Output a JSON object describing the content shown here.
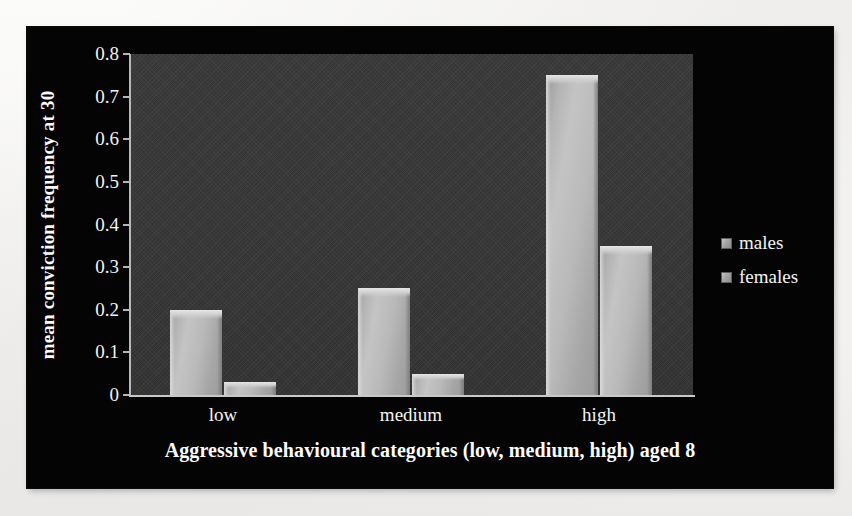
{
  "chart_data": {
    "type": "bar",
    "title": "",
    "xlabel": "Aggressive behavioural categories (low, medium, high) aged 8",
    "ylabel": "mean conviction frequency at 30",
    "categories": [
      "low",
      "medium",
      "high"
    ],
    "series": [
      {
        "name": "males",
        "values": [
          0.2,
          0.25,
          0.75
        ]
      },
      {
        "name": "females",
        "values": [
          0.03,
          0.05,
          0.35
        ]
      }
    ],
    "ylim": [
      0,
      0.8
    ],
    "ytick_labels": [
      "0.8",
      "0.7",
      "0.6",
      "0.5",
      "0.4",
      "0.3",
      "0.2",
      "0.1",
      "0"
    ],
    "ytick_values": [
      0.8,
      0.7,
      0.6,
      0.5,
      0.4,
      0.3,
      0.2,
      0.1,
      0
    ],
    "grid": false,
    "legend_position": "right",
    "legend_entries": [
      "males",
      "females"
    ],
    "colors": {
      "figure_background": "#040404",
      "plot_background": "#383838",
      "bar_fill": "#b4b4b4",
      "text": "#f4f4f4",
      "axis": "#c0c0c0"
    }
  },
  "legend": {
    "entries": [
      {
        "label": "males",
        "swatch": "legend-swatch-males"
      },
      {
        "label": "females",
        "swatch": "legend-swatch-females"
      }
    ]
  },
  "axes": {
    "y": {
      "label": "mean conviction frequency at 30",
      "ticks": [
        "0.8",
        "0.7",
        "0.6",
        "0.5",
        "0.4",
        "0.3",
        "0.2",
        "0.1",
        "0"
      ]
    },
    "x": {
      "label": "Aggressive behavioural categories (low, medium, high) aged 8",
      "ticks": [
        "low",
        "medium",
        "high"
      ]
    }
  },
  "bars": [
    {
      "group": "low",
      "series": "males",
      "value": 0.2
    },
    {
      "group": "low",
      "series": "females",
      "value": 0.03
    },
    {
      "group": "medium",
      "series": "males",
      "value": 0.25
    },
    {
      "group": "medium",
      "series": "females",
      "value": 0.05
    },
    {
      "group": "high",
      "series": "males",
      "value": 0.75
    },
    {
      "group": "high",
      "series": "females",
      "value": 0.35
    }
  ]
}
